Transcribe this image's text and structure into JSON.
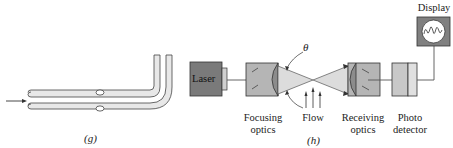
{
  "figure_g": {
    "caption": "(g)",
    "description": "Pitot-static tube with flow arrow entering from left"
  },
  "figure_h": {
    "caption": "(h)",
    "angle_symbol": "θ",
    "components": {
      "laser": "Laser",
      "focusing_optics": [
        "Focusing",
        "optics"
      ],
      "flow": "Flow",
      "receiving_optics": [
        "Receiving",
        "optics"
      ],
      "photo_detector": [
        "Photo",
        "detector"
      ],
      "display": "Display"
    }
  },
  "colors": {
    "laser_fill": "#7a7a7a",
    "optics_fill": "#b5b5b5",
    "lens_fill": "#8c8c8c",
    "beam_fill": "#dcdcdc",
    "detector_fill": "#c8c8c8",
    "display_fill": "#808080",
    "tube_fill": "#e6e6e6",
    "stroke": "#333333"
  }
}
